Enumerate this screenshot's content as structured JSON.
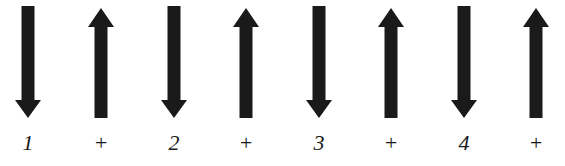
{
  "diagram": {
    "arrow_color": "#1a1a1a",
    "background": "#ffffff",
    "items": [
      {
        "direction": "down",
        "label": "1",
        "center_x": 28
      },
      {
        "direction": "up",
        "label": "+",
        "center_x": 101
      },
      {
        "direction": "down",
        "label": "2",
        "center_x": 174
      },
      {
        "direction": "up",
        "label": "+",
        "center_x": 246
      },
      {
        "direction": "down",
        "label": "3",
        "center_x": 319
      },
      {
        "direction": "up",
        "label": "+",
        "center_x": 391
      },
      {
        "direction": "down",
        "label": "4",
        "center_x": 464
      },
      {
        "direction": "up",
        "label": "+",
        "center_x": 536
      }
    ]
  }
}
